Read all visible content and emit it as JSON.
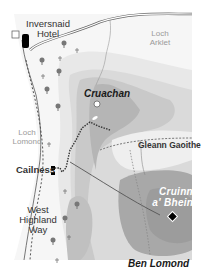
{
  "map": {
    "title": "Ben Lomond area walking map",
    "labels": {
      "inversnaid": "Inversnaid",
      "hotel": "Hotel",
      "loch_arklet_1": "Loch",
      "loch_arklet_2": "Arklet",
      "cruachan": "Cruachan",
      "loch_lomond_1": "Loch",
      "loch_lomond_2": "Lomond",
      "cailness": "Cailness",
      "gleann_gaoithe": "Gleann Gaoithe",
      "west_1": "West",
      "west_2": "Highland",
      "west_3": "Way",
      "cruinn_1": "Cruinn",
      "cruinn_2": "a' Bheinn",
      "ben_lomond": "Ben Lomond"
    },
    "colors": {
      "background": "#ffffff",
      "land": "#f4f4f4",
      "contour_1": "#e6e6e6",
      "contour_2": "#d6d6d6",
      "contour_3": "#c6c6c6",
      "contour_4": "#b3b3b3",
      "contour_5": "#a2a2a2",
      "route": "#333333",
      "road": "#555555"
    }
  }
}
